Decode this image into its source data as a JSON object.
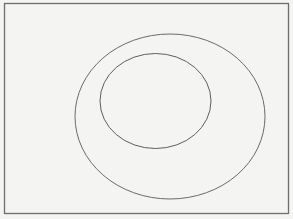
{
  "diagram": {
    "colors": {
      "background": "#f4f4f2",
      "frame": "#6e6e6e",
      "outer_ellipse": "#6a6a6a",
      "inner_ellipse": "#5e5e5e"
    },
    "shapes": [
      {
        "id": "outer-ellipse",
        "type": "ellipse"
      },
      {
        "id": "inner-ellipse",
        "type": "ellipse",
        "contained_in": "outer-ellipse"
      }
    ]
  }
}
